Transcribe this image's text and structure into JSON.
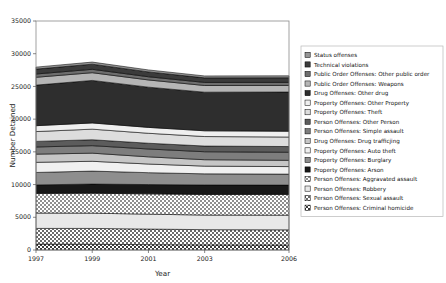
{
  "chart_data": {
    "type": "area",
    "stacked": true,
    "title": "",
    "xlabel": "Year",
    "ylabel": "Number Detained",
    "x": [
      1997,
      1999,
      2001,
      2003,
      2006
    ],
    "tick_labels_x": [
      "1997",
      "1999",
      "2001",
      "2003",
      "2006"
    ],
    "tick_labels_y": [
      "0",
      "5000",
      "10000",
      "15000",
      "20000",
      "25000",
      "30000",
      "35000"
    ],
    "ylim": [
      0,
      35000
    ],
    "xlim": [
      1997,
      2006
    ],
    "yticks": [
      0,
      5000,
      10000,
      15000,
      20000,
      25000,
      30000,
      35000
    ],
    "grid": false,
    "legend_position": "right",
    "totals": [
      27950,
      28500,
      26950,
      26000,
      26150
    ],
    "series": [
      {
        "name": "Person Offenses: Criminal homicide",
        "values": [
          900,
          880,
          820,
          780,
          760
        ],
        "pattern": "checker-dark",
        "color": "#9a9a9a"
      },
      {
        "name": "Person Offenses: Sexual assault",
        "values": [
          2400,
          2420,
          2380,
          2330,
          2320
        ],
        "pattern": "checker-mid",
        "color": "#a8a8a8"
      },
      {
        "name": "Person Offenses: Robbery",
        "values": [
          2350,
          2330,
          2280,
          2230,
          2240
        ],
        "pattern": "solid-light",
        "color": "#e2e2e2"
      },
      {
        "name": "Person Offenses: Aggravated assault",
        "values": [
          3000,
          3050,
          3100,
          3150,
          3180
        ],
        "pattern": "checker-light",
        "color": "#d0d0d0"
      },
      {
        "name": "Property Offenses: Arson",
        "values": [
          1300,
          1400,
          1420,
          1450,
          1420
        ],
        "pattern": "solid-black",
        "color": "#161616"
      },
      {
        "name": "Property Offenses: Burglary",
        "values": [
          1900,
          1980,
          1820,
          1700,
          1680
        ],
        "pattern": "solid-medgray",
        "color": "#8e8e8e"
      },
      {
        "name": "Property Offenses: Auto theft",
        "values": [
          1550,
          1500,
          1320,
          1180,
          1150
        ],
        "pattern": "solid-palegray",
        "color": "#efefef"
      },
      {
        "name": "Drug Offenses: Drug trafficjing",
        "values": [
          1250,
          1240,
          1100,
          980,
          960
        ],
        "pattern": "solid-lightgray",
        "color": "#c8c8c8"
      },
      {
        "name": "Person Offenses: Simple assault",
        "values": [
          1100,
          1150,
          1200,
          1220,
          1230
        ],
        "pattern": "solid-dimgray",
        "color": "#7b7b7b"
      },
      {
        "name": "Person Offenses: Other Person",
        "values": [
          850,
          900,
          880,
          870,
          870
        ],
        "pattern": "solid-darkgray",
        "color": "#5e5e5e"
      },
      {
        "name": "Property Offenses: Theft",
        "values": [
          1500,
          1620,
          1520,
          1450,
          1460
        ],
        "pattern": "solid-verylight",
        "color": "#dcdcdc"
      },
      {
        "name": "Property Offenses: Other Property",
        "values": [
          900,
          950,
          900,
          880,
          880
        ],
        "pattern": "solid-palest",
        "color": "#ededed"
      },
      {
        "name": "Drug Offenses: Other drug",
        "values": [
          6200,
          6500,
          6150,
          5900,
          6000
        ],
        "pattern": "solid-charcoal",
        "color": "#303030"
      },
      {
        "name": "Public Order Offenses: Weapons",
        "values": [
          1200,
          1180,
          1100,
          1020,
          1000
        ],
        "pattern": "solid-silver",
        "color": "#b4b4b4"
      },
      {
        "name": "Public Order Offenses: Other public order",
        "values": [
          500,
          520,
          490,
          470,
          470
        ],
        "pattern": "solid-gray2",
        "color": "#6d6d6d"
      },
      {
        "name": "Technical violations",
        "values": [
          750,
          780,
          740,
          700,
          710
        ],
        "pattern": "solid-dark2",
        "color": "#3c3c3c"
      },
      {
        "name": "Status offenses",
        "values": [
          300,
          320,
          300,
          290,
          290
        ],
        "pattern": "solid-gray3",
        "color": "#989898"
      }
    ]
  },
  "legend": {
    "items": [
      "Status offenses",
      "Technical violations",
      "Public Order Offenses: Other public order",
      "Public Order Offenses: Weapons",
      "Drug Offenses: Other drug",
      "Property Offenses: Other Property",
      "Property Offenses: Theft",
      "Person Offenses: Other Person",
      "Person Offenses: Simple assault",
      "Drug Offenses: Drug trafficjing",
      "Property Offenses: Auto theft",
      "Property Offenses: Burglary",
      "Property Offenses: Arson",
      "Person Offenses: Aggravated assault",
      "Person Offenses: Robbery",
      "Person Offenses: Sexual assault",
      "Person Offenses: Criminal homicide"
    ]
  }
}
